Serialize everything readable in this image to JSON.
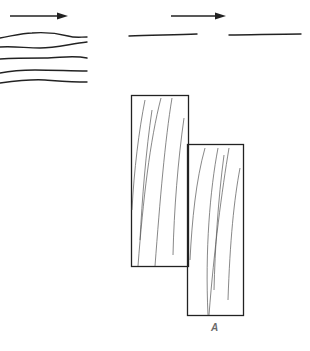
{
  "diagram": {
    "panels": [
      {
        "id": "left-flow",
        "description": "Arrow above five wavy parallel lines",
        "arrow_direction": "right",
        "line_count": 5
      },
      {
        "id": "right-flow",
        "description": "Arrow above two separated straight line segments",
        "arrow_direction": "right",
        "line_count": 2
      },
      {
        "id": "offset-blocks",
        "description": "Two overlapping rectangular blocks with grain lines, offset diagonally",
        "block_count": 2
      }
    ],
    "label": "A",
    "colors": {
      "stroke": "#222222",
      "grain": "#555555",
      "label": "#6a6a6a",
      "background": "#ffffff"
    }
  }
}
